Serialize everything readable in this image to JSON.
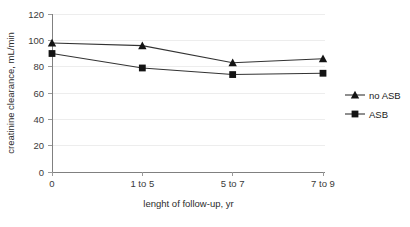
{
  "chart_data": {
    "type": "line",
    "title": "",
    "xlabel": "lenght of follow-up, yr",
    "ylabel": "creatinine clearance, mL/min",
    "categories": [
      "0",
      "1 to 5",
      "5 to 7",
      "7 to 9"
    ],
    "ylim": [
      0,
      120
    ],
    "yticks": [
      0,
      20,
      40,
      60,
      80,
      100,
      120
    ],
    "ytick_labels": [
      "0",
      "20",
      "40",
      "60",
      "80",
      "100",
      "120"
    ],
    "grid": "horizontal",
    "legend_position": "right",
    "series": [
      {
        "name": "no ASB",
        "marker": "triangle",
        "color": "#141414",
        "values": [
          98,
          96,
          83,
          86
        ]
      },
      {
        "name": "ASB",
        "marker": "square",
        "color": "#141414",
        "values": [
          90,
          79,
          74,
          75
        ]
      }
    ]
  },
  "legend": {
    "items": [
      {
        "label": "no ASB",
        "marker": "triangle"
      },
      {
        "label": "ASB",
        "marker": "square"
      }
    ]
  }
}
